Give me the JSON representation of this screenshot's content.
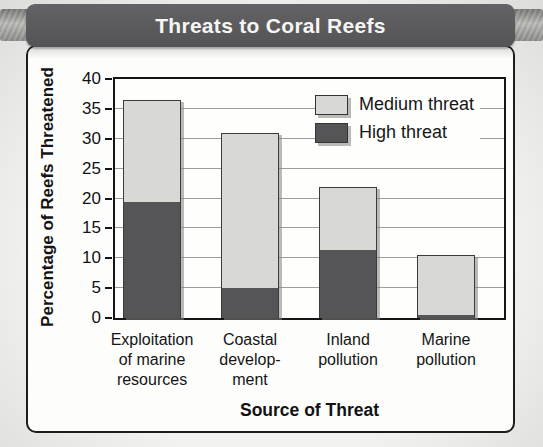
{
  "chart_data": {
    "type": "bar",
    "stacked": true,
    "title": "Threats to Coral Reefs",
    "xlabel": "Source of Threat",
    "ylabel": "Percentage of Reefs Threatened",
    "ylim": [
      0,
      40
    ],
    "yticks": [
      0,
      5,
      10,
      15,
      20,
      25,
      30,
      35,
      40
    ],
    "grid": true,
    "legend_position": "top-right",
    "categories": [
      "Exploitation\nof marine\nresources",
      "Coastal\ndevelop-\nment",
      "Inland\npollution",
      "Marine\npollution"
    ],
    "series": [
      {
        "name": "Medium threat",
        "color": "#d8d8d5",
        "values": [
          17,
          26,
          10.5,
          10
        ]
      },
      {
        "name": "High threat",
        "color": "#555557",
        "values": [
          19.5,
          5,
          11.5,
          0.5
        ]
      }
    ],
    "totals": [
      36.5,
      31,
      22,
      10.5
    ]
  },
  "colors": {
    "title_bar": "#58585a",
    "title_text": "#f6f6f4",
    "panel_background": "#fdfdfc",
    "panel_border": "#1d1d1d",
    "gridline": "#9d9d9b",
    "medium_threat": "#d8d8d5",
    "high_threat": "#555557",
    "rod": "#9a9a98"
  }
}
